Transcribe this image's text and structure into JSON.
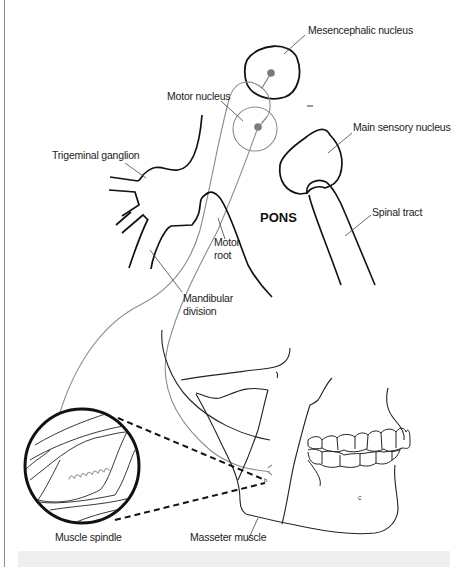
{
  "figure": {
    "region_label": "PONS",
    "labels": {
      "mesencephalic_nucleus": "Mesencephalic nucleus",
      "motor_nucleus": "Motor nucleus",
      "main_sensory_nucleus": "Main sensory nucleus",
      "trigeminal_ganglion": "Trigeminal ganglion",
      "spinal_tract": "Spinal tract",
      "motor_root_line1": "Motor",
      "motor_root_line2": "root",
      "mandibular_division_line1": "Mandibular",
      "mandibular_division_line2": "division",
      "muscle_spindle": "Muscle spindle",
      "masseter_muscle": "Masseter muscle"
    },
    "colors": {
      "structure_outline": "#111111",
      "nerve_pathway": "#8c8c8c",
      "neuron_soma": "#7a7a7a",
      "leader_line": "#444444",
      "bottom_bar": "#efefef"
    }
  }
}
